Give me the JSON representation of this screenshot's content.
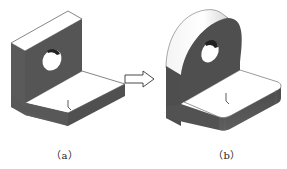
{
  "figure": {
    "panels": [
      {
        "id": "a",
        "caption": "（a）",
        "description": "L-shaped bracket with sharp corners and a through hole in the vertical plate"
      },
      {
        "id": "b",
        "caption": "（b）",
        "description": "L-shaped bracket with rounded (filleted) top plate, rounded base corners and a through hole"
      }
    ],
    "arrow": {
      "direction": "right",
      "meaning": "transforms-to"
    },
    "colors": {
      "shaded_face": "#555555",
      "lit_face": "#ffffff",
      "edge": "#333333"
    }
  }
}
